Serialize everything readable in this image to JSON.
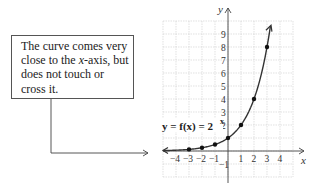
{
  "callout": {
    "line1": "The curve comes very",
    "line2_pre": "close to the ",
    "line2_var": "x",
    "line2_post": "-axis, but",
    "line3": "does not touch or",
    "line4": "cross it."
  },
  "graph": {
    "equation": "y = f(x) = 2",
    "exponent": "x",
    "x_axis_label": "x",
    "y_axis_label": "y"
  },
  "chart_data": {
    "type": "line",
    "title": "",
    "function": "y = f(x) = 2^x",
    "xlabel": "x",
    "ylabel": "y",
    "x": [
      -3,
      -2,
      -1,
      0,
      1,
      2,
      3
    ],
    "values": [
      0.125,
      0.25,
      0.5,
      1,
      2,
      4,
      8
    ],
    "points": [
      {
        "x": -3,
        "y": 0.125
      },
      {
        "x": -2,
        "y": 0.25
      },
      {
        "x": -1,
        "y": 0.5
      },
      {
        "x": 0,
        "y": 1
      },
      {
        "x": 1,
        "y": 2
      },
      {
        "x": 2,
        "y": 4
      },
      {
        "x": 3,
        "y": 8
      }
    ],
    "x_tick_labels": [
      "-4",
      "-3",
      "-2",
      "-1",
      "1",
      "2",
      "3",
      "4"
    ],
    "y_tick_labels": [
      "-1",
      "2",
      "3",
      "4",
      "5",
      "6",
      "7",
      "8",
      "9"
    ],
    "xlim": [
      -5,
      5
    ],
    "ylim": [
      -2,
      10
    ],
    "grid": true,
    "annotation": "The curve comes very close to the x-axis, but does not touch or cross it."
  }
}
